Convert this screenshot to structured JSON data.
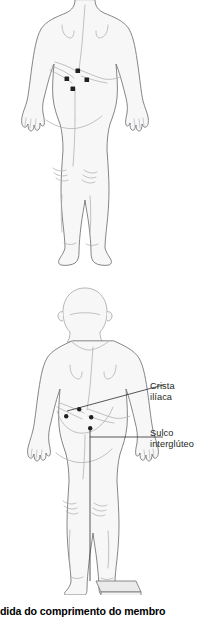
{
  "figure": {
    "domain_description": "Anatomical illustration, posterior view",
    "caption": "dida do comprimento do membro",
    "colors": {
      "body_fill": "#f7f7f8",
      "body_outline": "#6f7072",
      "body_outline_light": "#a8a9ab",
      "marker": "#231f20",
      "leader_line": "#231f20",
      "text": "#231f20",
      "caption_text": "#000000",
      "background": "#ffffff",
      "block_fill": "#ebebec"
    },
    "panels": [
      {
        "name": "upper-figure",
        "view": "posterior",
        "description": "Torso and legs, posterior view, head cropped off top",
        "markers": [
          {
            "name": "marker-iliac-crest-center",
            "x": 78,
            "y": 71
          },
          {
            "name": "marker-iliac-crest-left",
            "x": 67,
            "y": 79
          },
          {
            "name": "marker-iliac-crest-right",
            "x": 87,
            "y": 80
          },
          {
            "name": "marker-gluteal-cleft",
            "x": 73,
            "y": 89
          }
        ]
      },
      {
        "name": "lower-figure",
        "view": "posterior",
        "description": "Full body posterior view standing with right foot on a block, plumb line down midline",
        "markers": [
          {
            "name": "marker-iliac-crest-center",
            "x": 79,
            "y": 410
          },
          {
            "name": "marker-iliac-crest-left",
            "x": 66,
            "y": 417
          },
          {
            "name": "marker-iliac-crest-right",
            "x": 84,
            "y": 418
          },
          {
            "name": "marker-gluteal-cleft",
            "x": 75,
            "y": 428
          }
        ]
      }
    ],
    "labels": [
      {
        "id": "crista-iliaca",
        "text": "Crista\nilíaca",
        "lines": [
          "Crista",
          "ilíaca"
        ],
        "leader": {
          "from_x": 84,
          "from_y": 413,
          "to_x": 148,
          "to_y": 387
        }
      },
      {
        "id": "sulco-interglúteo",
        "text": "Sulco\ninterglúteo",
        "lines": [
          "Sulco",
          "interglúteo"
        ],
        "leader": {
          "from_x": 76,
          "from_y": 437,
          "to_x": 148,
          "to_y": 437
        }
      }
    ]
  }
}
